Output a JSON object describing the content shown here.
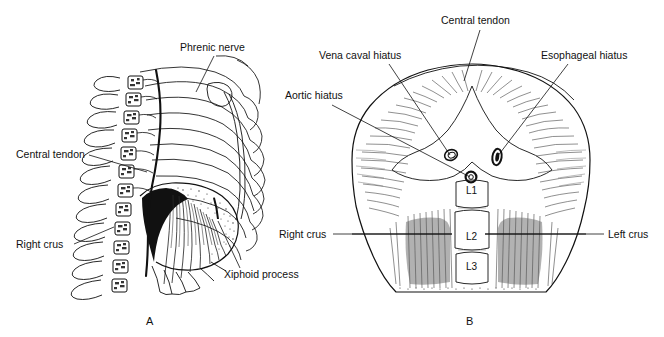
{
  "figure": {
    "background_color": "#ffffff",
    "ink_color": "#111111"
  },
  "panels": [
    {
      "id": "A",
      "letter": "A",
      "caption": "Lateral view of thorax showing diaphragm, ribs and vertebral column",
      "labels": [
        {
          "name": "phrenic-nerve",
          "text": "Phrenic nerve",
          "text_x": 180,
          "text_y": 51,
          "leader": "M 214 56 L 196 92"
        },
        {
          "name": "central-tendon",
          "text": "Central tendon",
          "text_x": 16,
          "text_y": 158,
          "leader": "M 89 155 L 147 172"
        },
        {
          "name": "right-crus",
          "text": "Right crus",
          "text_x": 16,
          "text_y": 248,
          "leader": "M 74 244 L 114 227"
        },
        {
          "name": "xiphoid-process",
          "text": "Xiphoid process",
          "text_x": 224,
          "text_y": 278,
          "leader": "M 240 268 L 218 221"
        }
      ]
    },
    {
      "id": "B",
      "letter": "B",
      "caption": "Inferior view of diaphragm showing hiatuses, crura and lumbar vertebrae",
      "labels": [
        {
          "name": "central-tendon",
          "text": "Central tendon",
          "text_x": 441,
          "text_y": 24,
          "leader": "M 480 30 L 464 81"
        },
        {
          "name": "vena-caval-hiatus",
          "text": "Vena caval hiatus",
          "text_x": 319,
          "text_y": 59,
          "leader": "M 389 64 L 450 155"
        },
        {
          "name": "aortic-hiatus",
          "text": "Aortic hiatus",
          "text_x": 285,
          "text_y": 99,
          "leader": "M 332 105 L 470 177"
        },
        {
          "name": "esophageal-hiatus",
          "text": "Esophageal hiatus",
          "text_x": 541,
          "text_y": 59,
          "leader": "M 568 64 L 497 157"
        },
        {
          "name": "right-crus",
          "text": "Right crus",
          "text_x": 279,
          "text_y": 238,
          "leader": "M 333 234 L 452 234"
        },
        {
          "name": "left-crus",
          "text": "Left crus",
          "text_x": 608,
          "text_y": 238,
          "leader": "M 604 234 L 485 234"
        }
      ],
      "vertebrae": [
        {
          "name": "vertebra-l1",
          "text": "L1",
          "x": 472,
          "y": 190
        },
        {
          "name": "vertebra-l2",
          "text": "L2",
          "x": 472,
          "y": 236
        },
        {
          "name": "vertebra-l3",
          "text": "L3",
          "x": 472,
          "y": 266
        }
      ],
      "hiatuses": [
        {
          "name": "vena-caval-hiatus-opening",
          "cx": 451,
          "cy": 155,
          "rx": 6.5,
          "ry": 5.2,
          "rotation": -20,
          "style": "open"
        },
        {
          "name": "esophageal-hiatus-opening",
          "cx": 497,
          "cy": 157,
          "rx": 4.6,
          "ry": 8.2,
          "rotation": 8,
          "style": "dark"
        },
        {
          "name": "aortic-hiatus-opening",
          "cx": 471,
          "cy": 177,
          "rx": 5.4,
          "ry": 5.4,
          "rotation": 0,
          "style": "dark"
        }
      ]
    }
  ],
  "panel_letters": [
    {
      "name": "panel-letter-a",
      "text": "A",
      "x": 146,
      "y": 325
    },
    {
      "name": "panel-letter-b",
      "text": "B",
      "x": 466,
      "y": 325
    }
  ]
}
